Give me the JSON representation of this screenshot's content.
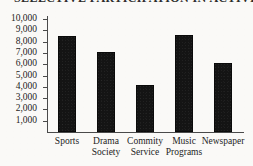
{
  "chart_data": {
    "type": "bar",
    "title": "SELECTIVE PARTICIPATION IN ACTIVITIES",
    "title_state": "cropped-at-top-edge",
    "categories": [
      "Sports",
      "Drama Society",
      "Commity Service",
      "Music Programs",
      "Newspaper"
    ],
    "category_lines": [
      [
        "Sports"
      ],
      [
        "Drama",
        "Society"
      ],
      [
        "Commity",
        "Service"
      ],
      [
        "Music",
        "Programs"
      ],
      [
        "Newspaper"
      ]
    ],
    "values": [
      8500,
      7050,
      4200,
      8600,
      6100
    ],
    "xlabel": "",
    "ylabel": "",
    "ylim": [
      0,
      10000
    ],
    "ytick_values": [
      10000,
      9000,
      8000,
      7000,
      6000,
      5000,
      4000,
      3000,
      2000,
      1000
    ],
    "ytick_labels": [
      "10,000",
      "9,000",
      "8,000",
      "7,000",
      "6,000",
      "5,000",
      "4,000",
      "3,000",
      "2,000",
      "1,000"
    ],
    "grid": false,
    "legend": null,
    "bar_color": "#141414",
    "axis_color": "#4a4a4a",
    "background_color": "#faf9f7"
  }
}
